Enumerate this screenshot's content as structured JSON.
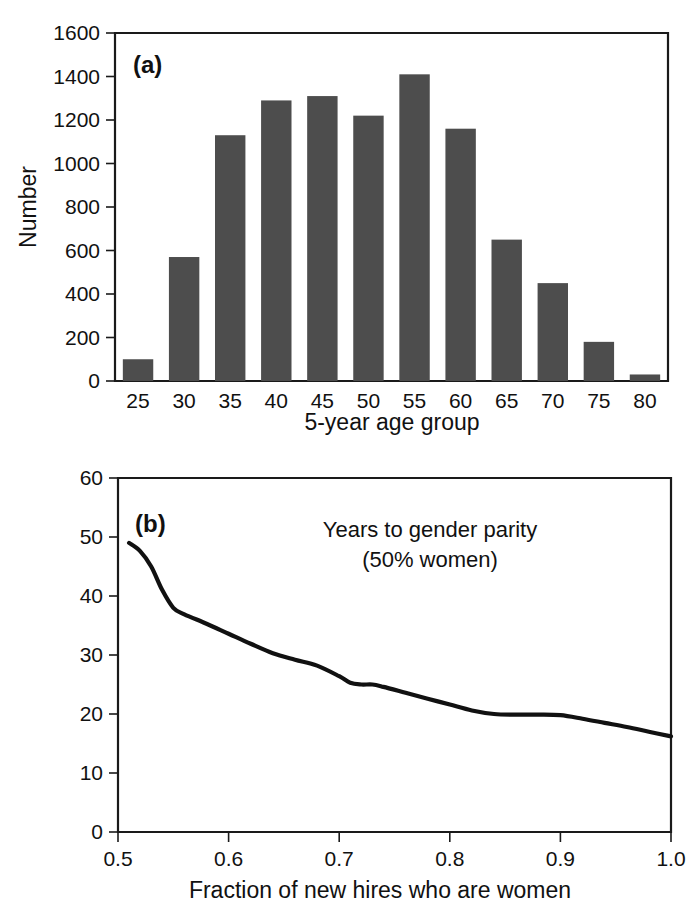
{
  "figure": {
    "background": "#ffffff",
    "ink_color": "#111111",
    "bar_color": "#4d4d4d",
    "line_color": "#111111"
  },
  "panels": [
    {
      "id": "a",
      "label": "(a)"
    },
    {
      "id": "b",
      "label": "(b)"
    }
  ],
  "chart_data": [
    {
      "type": "bar",
      "panel_label": "(a)",
      "title": "",
      "xlabel": "5-year age group",
      "ylabel": "Number",
      "categories": [
        "25",
        "30",
        "35",
        "40",
        "45",
        "50",
        "55",
        "60",
        "65",
        "70",
        "75",
        "80"
      ],
      "values": [
        100,
        570,
        1130,
        1290,
        1310,
        1220,
        1410,
        1160,
        650,
        450,
        180,
        30
      ],
      "xtick_labels": [
        "25",
        "30",
        "35",
        "40",
        "45",
        "50",
        "55",
        "60",
        "65",
        "70",
        "75",
        "80"
      ],
      "ytick_labels": [
        "0",
        "200",
        "400",
        "600",
        "800",
        "1000",
        "1200",
        "1400",
        "1600"
      ],
      "ytick_values": [
        0,
        200,
        400,
        600,
        800,
        1000,
        1200,
        1400,
        1600
      ],
      "ylim": [
        0,
        1600
      ],
      "grid": false,
      "legend": null,
      "bar_color": "#4d4d4d"
    },
    {
      "type": "line",
      "panel_label": "(b)",
      "title": "",
      "xlabel": "Fraction of new hires who are women",
      "ylabel": "",
      "annotation_line1": "Years to gender parity",
      "annotation_line2": "(50% women)",
      "xtick_labels": [
        "0.5",
        "0.6",
        "0.7",
        "0.8",
        "0.9",
        "1.0"
      ],
      "xtick_values": [
        0.5,
        0.6,
        0.7,
        0.8,
        0.9,
        1.0
      ],
      "ytick_labels": [
        "0",
        "10",
        "20",
        "30",
        "40",
        "50",
        "60"
      ],
      "ytick_values": [
        0,
        10,
        20,
        30,
        40,
        50,
        60
      ],
      "xlim": [
        0.5,
        1.0
      ],
      "ylim": [
        0,
        60
      ],
      "grid": false,
      "legend": null,
      "line_color": "#111111",
      "x": [
        0.51,
        0.52,
        0.53,
        0.54,
        0.55,
        0.56,
        0.58,
        0.6,
        0.62,
        0.64,
        0.66,
        0.68,
        0.7,
        0.71,
        0.72,
        0.73,
        0.74,
        0.76,
        0.78,
        0.8,
        0.82,
        0.84,
        0.86,
        0.88,
        0.9,
        0.92,
        0.94,
        0.96,
        0.98,
        1.0
      ],
      "y": [
        49.0,
        47.6,
        45.0,
        41.0,
        38.0,
        36.9,
        35.3,
        33.6,
        31.9,
        30.3,
        29.2,
        28.2,
        26.4,
        25.3,
        25.0,
        25.0,
        24.6,
        23.6,
        22.6,
        21.6,
        20.6,
        20.0,
        19.9,
        19.9,
        19.8,
        19.2,
        18.5,
        17.8,
        17.0,
        16.2
      ]
    }
  ]
}
